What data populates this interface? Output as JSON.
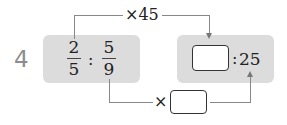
{
  "problem": {
    "number": "4",
    "left_ratio": {
      "first": {
        "numerator": "2",
        "denominator": "5"
      },
      "separator": ":",
      "second": {
        "numerator": "5",
        "denominator": "9"
      }
    },
    "right_ratio": {
      "first_blank": "",
      "separator": ":",
      "second": "25"
    },
    "top_operation": "×45",
    "bottom_operation": {
      "symbol": "×",
      "blank": ""
    }
  },
  "colors": {
    "box_background": "#dcdcdc",
    "number_label": "#8c8c8c",
    "connector_lines": "#888888"
  }
}
